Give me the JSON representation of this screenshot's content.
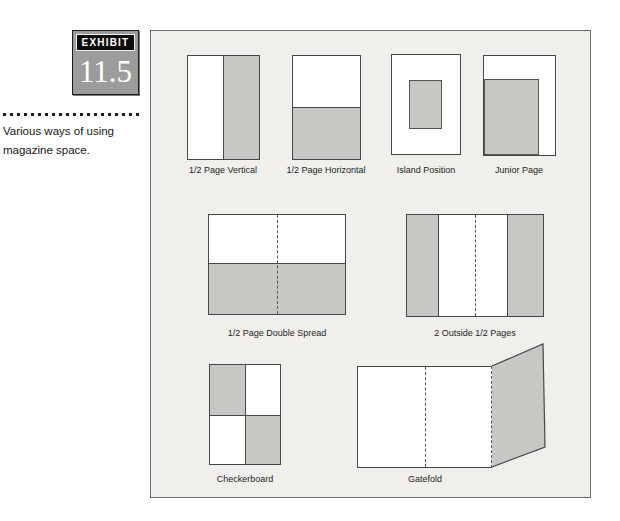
{
  "exhibit": {
    "label": "EXHIBIT",
    "number": "11.5"
  },
  "caption": {
    "text": "Various ways of using magazine space."
  },
  "figures": [
    {
      "id": "half-page-vertical",
      "label": "1/2 Page Vertical",
      "shaded_area": "right half"
    },
    {
      "id": "half-page-horizontal",
      "label": "1/2 Page Horizontal",
      "shaded_area": "bottom half"
    },
    {
      "id": "island-position",
      "label": "Island Position",
      "shaded_area": "centered block"
    },
    {
      "id": "junior-page",
      "label": "Junior Page",
      "shaded_area": "lower-left block"
    },
    {
      "id": "half-page-double-spread",
      "label": "1/2 Page Double Spread",
      "shaded_area": "bottom half across spread"
    },
    {
      "id": "two-outside-half-pages",
      "label": "2 Outside 1/2 Pages",
      "shaded_area": "outer vertical bars"
    },
    {
      "id": "checkerboard",
      "label": "Checkerboard",
      "shaded_area": "top-left and bottom-right quadrants"
    },
    {
      "id": "gatefold",
      "label": "Gatefold",
      "shaded_area": "folded-out right panel"
    }
  ],
  "colors": {
    "page_bg": "#ffffff",
    "panel_bg": "#f0efec",
    "shade_fill": "#c8c7c3",
    "badge_bg": "#9c9c9c",
    "line": "#474747"
  }
}
